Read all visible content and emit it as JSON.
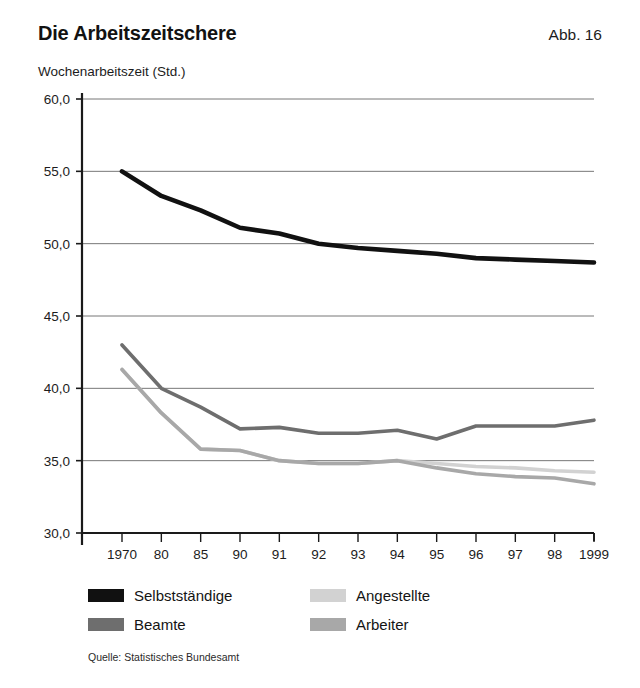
{
  "header": {
    "title": "Die Arbeitszeitschere",
    "figure_label": "Abb. 16"
  },
  "source_note": "Quelle: Statistisches Bundesamt",
  "colors": {
    "selbststaendige": "#111111",
    "beamte": "#6e6e6e",
    "angestellte": "#d2d2d2",
    "arbeiter": "#a8a8a8",
    "grid": "#777777",
    "axis": "#1a1a1a",
    "background": "#ffffff"
  },
  "legend": {
    "position": "below-plot",
    "items": [
      {
        "label": "Selbstständige",
        "color": "#111111"
      },
      {
        "label": "Beamte",
        "color": "#6e6e6e"
      },
      {
        "label": "Angestellte",
        "color": "#d2d2d2"
      },
      {
        "label": "Arbeiter",
        "color": "#a8a8a8"
      }
    ]
  },
  "chart_data": {
    "type": "line",
    "title": "Die Arbeitszeitschere",
    "subtitle": "Abb. 16",
    "xlabel": "",
    "ylabel": "Wochenarbeitszeit (Std.)",
    "ylim": [
      30.0,
      60.0
    ],
    "yticks": [
      30.0,
      35.0,
      40.0,
      45.0,
      50.0,
      55.0,
      60.0
    ],
    "ytick_labels": [
      "30,0",
      "35,0",
      "40,0",
      "45,0",
      "50,0",
      "55,0",
      "60,0"
    ],
    "grid": true,
    "grid_axis": "y",
    "categories": [
      "1970",
      "80",
      "85",
      "90",
      "91",
      "92",
      "93",
      "94",
      "95",
      "96",
      "97",
      "98",
      "1999"
    ],
    "xtick_labels": [
      "1970",
      "80",
      "85",
      "90",
      "91",
      "92",
      "93",
      "94",
      "95",
      "96",
      "97",
      "98",
      "1999"
    ],
    "legend_position": "below",
    "series": [
      {
        "name": "Selbstständige",
        "color": "#111111",
        "values": [
          55.0,
          53.3,
          52.3,
          51.1,
          50.7,
          50.0,
          49.7,
          49.5,
          49.3,
          49.0,
          48.9,
          48.8,
          48.7
        ]
      },
      {
        "name": "Beamte",
        "color": "#6e6e6e",
        "values": [
          43.0,
          40.0,
          38.7,
          37.2,
          37.3,
          36.9,
          36.9,
          37.1,
          36.5,
          37.4,
          37.4,
          37.4,
          37.8
        ]
      },
      {
        "name": "Angestellte",
        "color": "#d2d2d2",
        "values": [
          41.3,
          38.3,
          35.8,
          35.7,
          35.0,
          34.8,
          34.8,
          35.0,
          34.8,
          34.6,
          34.5,
          34.3,
          34.2
        ]
      },
      {
        "name": "Arbeiter",
        "color": "#a8a8a8",
        "values": [
          41.3,
          38.3,
          35.8,
          35.7,
          35.0,
          34.8,
          34.8,
          35.0,
          34.5,
          34.1,
          33.9,
          33.8,
          33.4
        ]
      }
    ]
  }
}
